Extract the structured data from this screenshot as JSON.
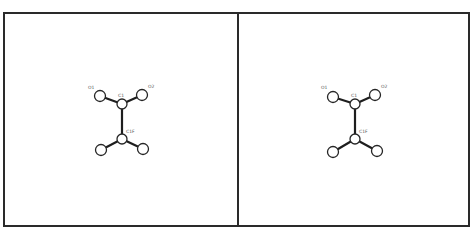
{
  "figure": {
    "type": "stereo-pair molecular structure diagram",
    "frame": {
      "left": 4,
      "top": 13,
      "right": 469,
      "bottom": 226,
      "divider_x": 238,
      "stroke_color": "#2a2a2a"
    },
    "panels": [
      {
        "id": "left-view",
        "atoms": [
          {
            "id": "O1",
            "label": "O1",
            "x": 100,
            "y": 96,
            "r": 5.5,
            "label_x": 88,
            "label_y": 89
          },
          {
            "id": "O2",
            "label": "O2",
            "x": 142,
            "y": 95,
            "r": 5.5,
            "label_x": 148,
            "label_y": 88
          },
          {
            "id": "C1",
            "label": "C1",
            "x": 122,
            "y": 104,
            "r": 5,
            "label_x": 118,
            "label_y": 97
          },
          {
            "id": "C1F",
            "label": "C1F",
            "x": 122,
            "y": 139,
            "r": 5,
            "label_x": 126,
            "label_y": 133
          },
          {
            "id": "X1",
            "label": "",
            "x": 101,
            "y": 150,
            "r": 5.5
          },
          {
            "id": "X2",
            "label": "",
            "x": 143,
            "y": 149,
            "r": 5.5
          }
        ],
        "bonds": [
          [
            "O1",
            "C1"
          ],
          [
            "O2",
            "C1"
          ],
          [
            "C1",
            "C1F"
          ],
          [
            "C1F",
            "X1"
          ],
          [
            "C1F",
            "X2"
          ]
        ]
      },
      {
        "id": "right-view",
        "atoms": [
          {
            "id": "O1",
            "label": "O1",
            "x": 333,
            "y": 97,
            "r": 5.5,
            "label_x": 321,
            "label_y": 89
          },
          {
            "id": "O2",
            "label": "O2",
            "x": 375,
            "y": 95,
            "r": 5.5,
            "label_x": 381,
            "label_y": 88
          },
          {
            "id": "C1",
            "label": "C1",
            "x": 355,
            "y": 104,
            "r": 5,
            "label_x": 351,
            "label_y": 97
          },
          {
            "id": "C1F",
            "label": "C1F",
            "x": 355,
            "y": 139,
            "r": 5,
            "label_x": 359,
            "label_y": 133
          },
          {
            "id": "X1",
            "label": "",
            "x": 333,
            "y": 152,
            "r": 5.5
          },
          {
            "id": "X2",
            "label": "",
            "x": 377,
            "y": 151,
            "r": 5.5
          }
        ],
        "bonds": [
          [
            "O1",
            "C1"
          ],
          [
            "O2",
            "C1"
          ],
          [
            "C1",
            "C1F"
          ],
          [
            "C1F",
            "X1"
          ],
          [
            "C1F",
            "X2"
          ]
        ]
      }
    ]
  }
}
